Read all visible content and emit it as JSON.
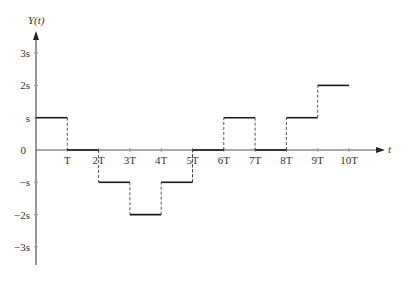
{
  "chart_data": {
    "type": "line",
    "subtype": "step",
    "title": "",
    "xlabel": "t",
    "ylabel": "Y(t)",
    "x_ticks": [
      "T",
      "2T",
      "3T",
      "4T",
      "5T",
      "6T",
      "7T",
      "8T",
      "9T",
      "10T"
    ],
    "y_ticks": [
      "3s",
      "2s",
      "s",
      "0",
      "−s",
      "−2s",
      "−3s"
    ],
    "y_tick_values": [
      3,
      2,
      1,
      0,
      -1,
      -2,
      -3
    ],
    "xlim": [
      0,
      11
    ],
    "ylim": [
      -3.5,
      3.7
    ],
    "grid": false,
    "units": {
      "x": "T",
      "y": "s"
    },
    "segments": [
      {
        "x_start": 0,
        "x_end": 1,
        "y": 1
      },
      {
        "x_start": 1,
        "x_end": 2,
        "y": 0
      },
      {
        "x_start": 2,
        "x_end": 3,
        "y": -1
      },
      {
        "x_start": 3,
        "x_end": 4,
        "y": -2
      },
      {
        "x_start": 4,
        "x_end": 5,
        "y": -1
      },
      {
        "x_start": 5,
        "x_end": 6,
        "y": 0
      },
      {
        "x_start": 6,
        "x_end": 7,
        "y": 1
      },
      {
        "x_start": 7,
        "x_end": 8,
        "y": 0
      },
      {
        "x_start": 8,
        "x_end": 9,
        "y": 1
      },
      {
        "x_start": 9,
        "x_end": 10,
        "y": 2
      }
    ],
    "x": [
      0,
      1,
      2,
      3,
      4,
      5,
      6,
      7,
      8,
      9
    ],
    "values": [
      1,
      0,
      -1,
      -2,
      -1,
      0,
      1,
      0,
      1,
      2
    ],
    "transitions_style": "dashed vertical lines",
    "legend": null
  },
  "labels": {
    "y_axis_title": "Y(t)",
    "x_axis_title": "t",
    "zero": "0"
  },
  "colors": {
    "line": "#1a1a1a",
    "axis": "#555555",
    "dashed": "#444444"
  }
}
